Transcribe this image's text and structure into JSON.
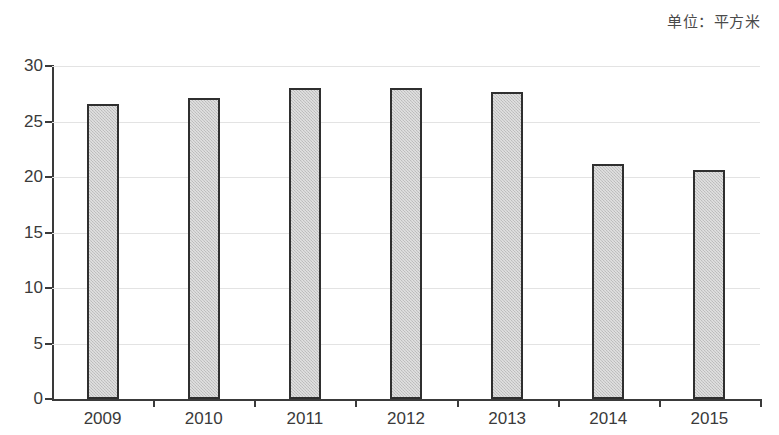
{
  "unit_caption": "单位：平方米",
  "chart_data": {
    "type": "bar",
    "title": "",
    "subtitle": "",
    "xlabel": "",
    "ylabel": "",
    "unit_label": "单位：平方米",
    "categories": [
      "2009",
      "2010",
      "2011",
      "2012",
      "2013",
      "2014",
      "2015"
    ],
    "values": [
      26.6,
      27.1,
      28.0,
      28.0,
      27.7,
      21.2,
      20.6
    ],
    "series": [
      {
        "name": "人均住房面积",
        "values": [
          26.6,
          27.1,
          28.0,
          28.0,
          27.7,
          21.2,
          20.6
        ]
      }
    ],
    "ylim": [
      0,
      30
    ],
    "ytick_values": [
      0,
      5,
      10,
      15,
      20,
      25,
      30
    ],
    "ytick_labels": [
      "0",
      "5",
      "10",
      "15",
      "20",
      "25",
      "30"
    ],
    "grid": true,
    "grid_axis": "y",
    "legend": false,
    "legend_position": "none",
    "bar_fill_color": "#c6c6c6",
    "bar_edge_color": "#2f2f2f",
    "gridline_color": "#e3e3e3",
    "axis_color": "#3a3a3a",
    "background_color": "#ffffff"
  }
}
